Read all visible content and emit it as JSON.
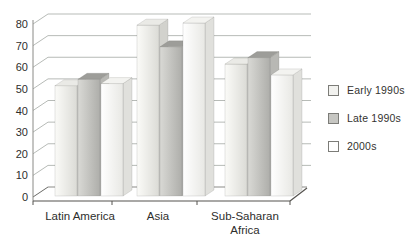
{
  "chart_data": {
    "type": "bar",
    "style": "3d-clustered-column",
    "title": "",
    "xlabel": "",
    "ylabel": "",
    "categories": [
      "Latin America",
      "Asia",
      "Sub-Saharan Africa"
    ],
    "category_label_lines": [
      [
        "Latin America"
      ],
      [
        "Asia"
      ],
      [
        "Sub-Saharan",
        "Africa"
      ]
    ],
    "series": [
      {
        "name": "Early 1990s",
        "values": [
          51,
          79,
          61
        ],
        "colors": {
          "front_left": "#fbfbf8",
          "front_right": "#dbdbd6",
          "top": "#eaeae6",
          "side": "#d2d2cd",
          "legend": "#f2f2ef"
        }
      },
      {
        "name": "Late 1990s",
        "values": [
          54,
          69,
          64
        ],
        "colors": {
          "front_left": "#d9d9d5",
          "front_right": "#aeaeaa",
          "top": "#9d9d99",
          "side": "#b8b8b4",
          "legend": "#c6c6c2"
        }
      },
      {
        "name": "2000s",
        "values": [
          52,
          80,
          56
        ],
        "colors": {
          "front_left": "#ffffff",
          "front_right": "#e8e8e4",
          "top": "#f3f3f0",
          "side": "#e0e0dc",
          "legend": "#ffffff"
        }
      }
    ],
    "ylim": [
      0,
      80
    ],
    "yticks": [
      0,
      10,
      20,
      30,
      40,
      50,
      60,
      70,
      80
    ],
    "grid": true,
    "legend_position": "right",
    "axis_color": "#55534f",
    "gridline_color": "#b7bbb7",
    "text_color": "#2e2e2c"
  },
  "legend": {
    "items": [
      {
        "label": "Early 1990s"
      },
      {
        "label": "Late 1990s"
      },
      {
        "label": "2000s"
      }
    ]
  }
}
